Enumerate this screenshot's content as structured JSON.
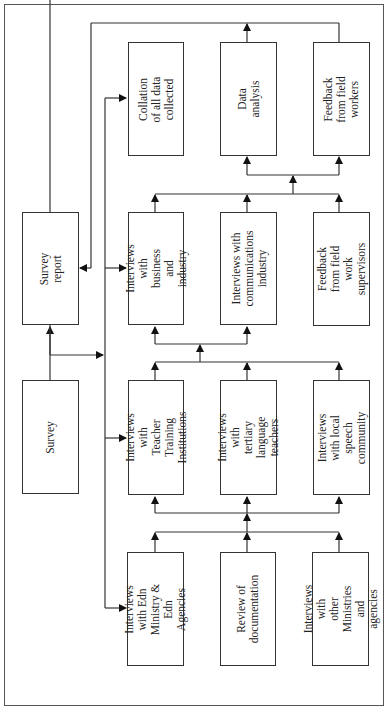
{
  "diagram": {
    "type": "flowchart",
    "orientation": "rotated-90-ccw",
    "nodes": {
      "survey": "Survey",
      "survey_report": "Survey report",
      "edn_ministry": "Interviews with Edn\nMinistry & Edn\nAgencies",
      "review_documentation": "Review of\ndocumentation",
      "other_ministries": "Interviews with\nother Ministries and\nagencies",
      "teacher_training": "Interviews with\nTeacher Training\nInstitutions",
      "tertiary_teachers": "Interviews with\ntertiary language\nteachers",
      "local_speech": "Interviews with local\nspeech community",
      "business_industry": "Interviews with\nbusiness and\nindustry",
      "communications_industry": "Interviews with\ncommunications\nindustry",
      "feedback_supervisors": "Feedback from field\nwork supervisors",
      "collation": "Collation of all data\ncollected",
      "data_analysis": "Data analysis",
      "feedback_workers": "Feedback from field\nworkers"
    },
    "edges": [
      [
        "survey",
        "survey_report"
      ],
      [
        "survey",
        "edn_ministry"
      ],
      [
        "survey",
        "teacher_training"
      ],
      [
        "survey",
        "business_industry"
      ],
      [
        "survey",
        "collation"
      ],
      [
        "edn_ministry+review_documentation+other_ministries",
        "teacher_training+tertiary_teachers+local_speech"
      ],
      [
        "teacher_training+tertiary_teachers+local_speech",
        "business_industry+communications_industry+feedback_supervisors"
      ],
      [
        "business_industry+communications_industry+feedback_supervisors",
        "data_analysis+feedback_workers"
      ],
      [
        "data_analysis+feedback_workers",
        "survey_report"
      ]
    ]
  }
}
